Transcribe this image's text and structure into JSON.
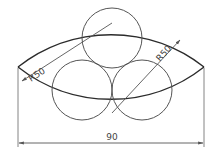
{
  "drawing": {
    "colors": {
      "outline": "#2b2b2b",
      "circle": "#555555",
      "dimension": "#555555",
      "text": "#444444",
      "background": "#ffffff"
    },
    "lens": {
      "left_point": [
        18,
        67
      ],
      "right_point": [
        204,
        67
      ],
      "top_arc_radius": 150,
      "bottom_arc_radius": 150
    },
    "circles": [
      {
        "name": "top-circle",
        "cx": 112,
        "cy": 38,
        "r": 30
      },
      {
        "name": "bottom-left-circle",
        "cx": 82,
        "cy": 90,
        "r": 30
      },
      {
        "name": "bottom-right-circle",
        "cx": 142,
        "cy": 90,
        "r": 30
      }
    ],
    "dimensions": {
      "left_radius_label": "R50",
      "right_radius_label": "R50",
      "width_label": "90"
    }
  }
}
